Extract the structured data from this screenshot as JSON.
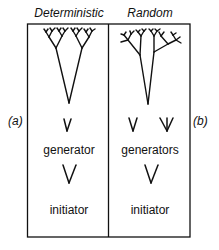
{
  "panels": {
    "left": {
      "title": "Deterministic",
      "side_label": "(a)",
      "generator_label": "generator",
      "initiator_label": "initiator"
    },
    "right": {
      "title": "Random",
      "side_label": "(b)",
      "generator_label": "generators",
      "initiator_label": "initiator"
    }
  },
  "colors": {
    "stroke": "#111111",
    "background": "#ffffff"
  }
}
